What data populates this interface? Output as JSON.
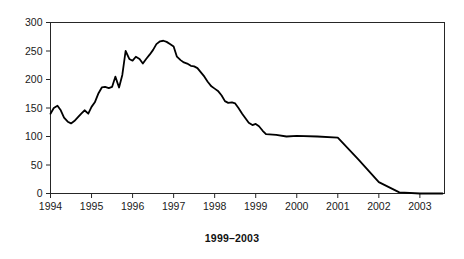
{
  "caption": "1999–2003",
  "chart_data": {
    "type": "line",
    "title": "",
    "subtitle": "",
    "xlabel": "",
    "ylabel": "",
    "xlim": [
      1994,
      2003.6
    ],
    "ylim": [
      0,
      300
    ],
    "grid": false,
    "legend": null,
    "x_tick_labels": [
      "1994",
      "1995",
      "1996",
      "1997",
      "1998",
      "1999",
      "2000",
      "2001",
      "2002",
      "2003"
    ],
    "x_tick_values": [
      1994,
      1995,
      1996,
      1997,
      1998,
      1999,
      2000,
      2001,
      2002,
      2003
    ],
    "y_tick_labels": [
      "0",
      "50",
      "100",
      "150",
      "200",
      "250",
      "300"
    ],
    "y_tick_values": [
      0,
      50,
      100,
      150,
      200,
      250,
      300
    ],
    "line_color": "#000000",
    "line_width": 1.8,
    "series": [
      {
        "name": "",
        "x": [
          1994.0,
          1994.08,
          1994.17,
          1994.25,
          1994.33,
          1994.42,
          1994.5,
          1994.58,
          1994.67,
          1994.75,
          1994.83,
          1994.92,
          1995.0,
          1995.08,
          1995.17,
          1995.25,
          1995.33,
          1995.42,
          1995.5,
          1995.58,
          1995.67,
          1995.75,
          1995.83,
          1995.92,
          1996.0,
          1996.08,
          1996.17,
          1996.25,
          1996.33,
          1996.42,
          1996.5,
          1996.58,
          1996.67,
          1996.75,
          1996.83,
          1996.92,
          1997.0,
          1997.08,
          1997.17,
          1997.25,
          1997.33,
          1997.42,
          1997.5,
          1997.58,
          1997.67,
          1997.75,
          1997.83,
          1997.92,
          1998.0,
          1998.08,
          1998.17,
          1998.25,
          1998.33,
          1998.42,
          1998.5,
          1998.58,
          1998.67,
          1998.75,
          1998.83,
          1998.92,
          1999.0,
          1999.08,
          1999.17,
          1999.25,
          1999.5,
          1999.75,
          2000.0,
          2000.5,
          2001.0,
          2001.5,
          2002.0,
          2002.5,
          2003.0,
          2003.55
        ],
        "values": [
          140,
          150,
          154,
          146,
          133,
          126,
          123,
          127,
          134,
          140,
          146,
          140,
          152,
          160,
          176,
          186,
          187,
          185,
          187,
          205,
          186,
          208,
          250,
          236,
          233,
          240,
          236,
          228,
          236,
          244,
          252,
          262,
          267,
          268,
          266,
          262,
          258,
          240,
          234,
          230,
          228,
          224,
          223,
          220,
          212,
          205,
          196,
          188,
          184,
          180,
          172,
          162,
          159,
          160,
          158,
          150,
          140,
          132,
          124,
          120,
          122,
          118,
          110,
          104,
          103,
          100,
          101,
          100,
          98,
          60,
          20,
          2,
          0,
          0
        ]
      }
    ],
    "annotations": []
  }
}
